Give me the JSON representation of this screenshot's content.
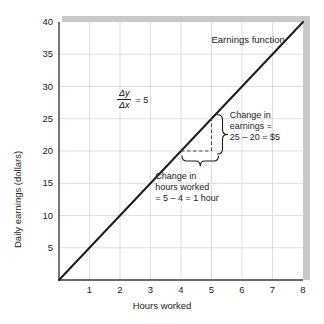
{
  "chart_data": {
    "type": "line",
    "title": "",
    "xlabel": "Hours worked",
    "ylabel": "Daily earnings (dollars)",
    "xlim": [
      0,
      8
    ],
    "ylim": [
      0,
      40
    ],
    "grid": true,
    "legend_position": "inside-top-right",
    "xticks": [
      "1",
      "2",
      "3",
      "4",
      "5",
      "6",
      "7",
      "8"
    ],
    "xtick_values": [
      1,
      2,
      3,
      4,
      5,
      6,
      7,
      8
    ],
    "yticks": [
      "5",
      "10",
      "15",
      "20",
      "25",
      "30",
      "35",
      "40"
    ],
    "ytick_values": [
      5,
      10,
      15,
      20,
      25,
      30,
      35,
      40
    ],
    "series": [
      {
        "name": "Earnings function",
        "slope": 5,
        "intercept": 0,
        "x": [
          0,
          8
        ],
        "values": [
          0,
          40
        ],
        "color": "#1b1b1b"
      }
    ],
    "annotations": [
      {
        "name": "series-label",
        "text": "Earnings function",
        "x": 5.0,
        "y": 37.2
      },
      {
        "name": "slope-fraction",
        "numerator": "Δy",
        "denominator": "Δx",
        "equals": "= 5",
        "x": 1.9,
        "y": 28.0
      },
      {
        "name": "change-in-earnings",
        "line1": "Change in",
        "line2": "earnings =",
        "line3": "25 – 20 = $5",
        "x": 5.6,
        "y": 25.0
      },
      {
        "name": "change-in-hours",
        "line1": "Change in",
        "line2": "hours worked",
        "line3": "= 5 – 4 = 1 hour",
        "x": 4.6,
        "y": 16.0
      }
    ],
    "guides": {
      "run": {
        "from_x": 4,
        "to_x": 5,
        "at_y": 20,
        "style": "dashed"
      },
      "rise": {
        "at_x": 5,
        "from_y": 20,
        "to_y": 25,
        "style": "dashed"
      }
    },
    "colors": {
      "line": "#1b1b1b",
      "grid": "#d6d6d6",
      "axis": "#3a3a3a",
      "shadow": "#c8c8c8",
      "background": "#ffffff",
      "text": "#1b1b1b"
    }
  }
}
